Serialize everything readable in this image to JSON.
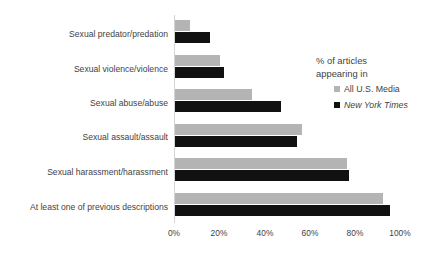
{
  "chart_data": {
    "type": "bar",
    "orientation": "horizontal",
    "title": "",
    "xlabel": "",
    "ylabel": "",
    "xlim": [
      0,
      100
    ],
    "xticks": [
      "0%",
      "20%",
      "40%",
      "60%",
      "80%",
      "100%"
    ],
    "xtick_values": [
      0,
      20,
      40,
      60,
      80,
      100
    ],
    "grid": false,
    "legend_position": "right",
    "categories": [
      "Sexual predator/predation",
      "Sexual violence/violence",
      "Sexual abuse/abuse",
      "Sexual assault/assault",
      "Sexual harassment/harassment",
      "At least one of previous descriptions"
    ],
    "series": [
      {
        "name": "All U.S. Media",
        "color": "#b4b4b4",
        "values": [
          6.5,
          20,
          34,
          56,
          76,
          92
        ]
      },
      {
        "name": "New York Times",
        "color": "#111111",
        "values": [
          15.5,
          21.5,
          47,
          54,
          77,
          95
        ]
      }
    ]
  },
  "legend": {
    "title_line1": "% of articles",
    "title_line2": "appearing in",
    "entries": [
      {
        "label": "All U.S. Media",
        "swatch": "media-swatch",
        "italic": false
      },
      {
        "label": "New York Times",
        "swatch": "nyt-swatch",
        "italic": true
      }
    ]
  }
}
